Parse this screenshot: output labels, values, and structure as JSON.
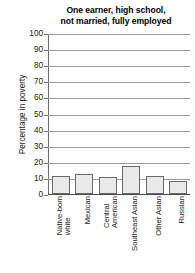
{
  "chart_data": {
    "type": "bar",
    "title": "One earner, high school, not married, fully employed",
    "title_lines": [
      "One earner, high school,",
      "not married, fully employed"
    ],
    "xlabel": "",
    "ylabel": "Percentage in poverty",
    "ylim": [
      0,
      100
    ],
    "ytick_step": 10,
    "yticks": [
      100,
      90,
      80,
      70,
      60,
      50,
      40,
      30,
      20,
      10,
      0
    ],
    "grid": true,
    "legend": "none",
    "categories": [
      "Native-born white",
      "Mexican",
      "Central American",
      "Southeast Asian",
      "Other Asian",
      "Russian"
    ],
    "category_lines": [
      [
        "Native-born",
        "white"
      ],
      [
        "Mexican"
      ],
      [
        "Central",
        "American"
      ],
      [
        "Southeast Asian"
      ],
      [
        "Other Asian"
      ],
      [
        "Russian"
      ]
    ],
    "values": [
      12,
      13,
      11,
      18,
      12,
      9
    ],
    "bars": [
      {
        "label": "Native-born white",
        "value": 12
      },
      {
        "label": "Mexican",
        "value": 13
      },
      {
        "label": "Central American",
        "value": 11
      },
      {
        "label": "Southeast Asian",
        "value": 18
      },
      {
        "label": "Other Asian",
        "value": 12
      },
      {
        "label": "Russian",
        "value": 9
      }
    ],
    "colors": {
      "bar_fill": "#e9e9e9",
      "bar_stroke": "#6a6a6a",
      "gridline": "#9a9a9a",
      "axis": "#4a4a4a",
      "text": "#1a1a1a",
      "background": "#ffffff"
    }
  }
}
